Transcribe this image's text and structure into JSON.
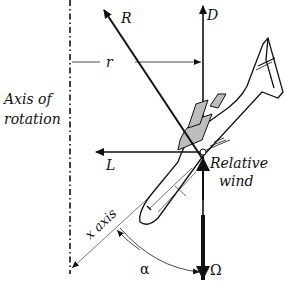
{
  "diagram": {
    "type": "force-diagram",
    "labels": {
      "axis_line1": "Axis of",
      "axis_line2": "rotation",
      "r": "r",
      "R": "R",
      "D": "D",
      "L": "L",
      "relative_wind_line1": "Relative",
      "relative_wind_line2": "wind",
      "x_axis": "x axis",
      "alpha": "α",
      "omega": "Ω"
    },
    "colors": {
      "ink": "#111111",
      "shading": "#bdbdbd",
      "background": "#ffffff"
    }
  }
}
